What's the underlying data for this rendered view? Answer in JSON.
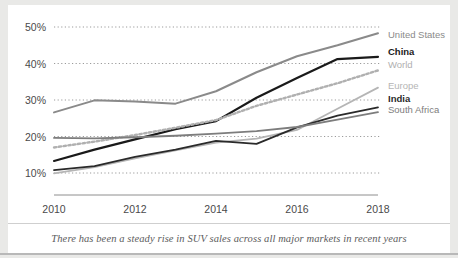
{
  "caption": "There has been a steady rise in SUV sales across all major markets in recent years",
  "axis": {
    "y_ticks": [
      "10%",
      "20%",
      "30%",
      "40%",
      "50%"
    ],
    "x_ticks": [
      "2010",
      "2012",
      "2014",
      "2016",
      "2018"
    ]
  },
  "legend": [
    {
      "label": "United States",
      "color": "#8a8a8a",
      "bold": false
    },
    {
      "label": "China",
      "color": "#1a1a1a",
      "bold": true
    },
    {
      "label": "World",
      "color": "#b0b0b0",
      "bold": false
    },
    {
      "label": "Europe",
      "color": "#b5b5b5",
      "bold": false
    },
    {
      "label": "India",
      "color": "#2a2a2a",
      "bold": true
    },
    {
      "label": "South Africa",
      "color": "#7d7d7d",
      "bold": false
    }
  ],
  "chart_data": {
    "type": "line",
    "title": "",
    "subtitle": "",
    "xlabel": "",
    "ylabel": "",
    "x": [
      2010,
      2011,
      2012,
      2013,
      2014,
      2015,
      2016,
      2017,
      2018
    ],
    "xlim": [
      2010,
      2018
    ],
    "ylim": [
      8,
      51
    ],
    "ytick_values": [
      10,
      20,
      30,
      40,
      50
    ],
    "xtick_values": [
      2010,
      2012,
      2014,
      2016,
      2018
    ],
    "grid": "horizontal-dotted",
    "legend_position": "right-of-plot-line-end",
    "units": "percent",
    "series": [
      {
        "name": "United States",
        "color": "#8a8a8a",
        "style": "solid",
        "width": 2.0,
        "values": [
          26.6,
          29.9,
          29.6,
          29.0,
          32.4,
          37.6,
          42.0,
          45.0,
          48.3
        ]
      },
      {
        "name": "China",
        "color": "#1a1a1a",
        "style": "solid",
        "width": 2.2,
        "values": [
          13.3,
          16.4,
          19.2,
          22.0,
          24.2,
          30.6,
          36.0,
          41.2,
          41.8
        ]
      },
      {
        "name": "World",
        "color": "#b0b0b0",
        "style": "dotted",
        "width": 2.4,
        "values": [
          17.0,
          18.6,
          20.4,
          22.4,
          24.5,
          28.4,
          31.5,
          34.6,
          38.1
        ]
      },
      {
        "name": "Europe",
        "color": "#b5b5b5",
        "style": "solid",
        "width": 1.8,
        "values": [
          9.9,
          11.6,
          14.0,
          16.2,
          18.3,
          19.4,
          21.8,
          27.6,
          33.4
        ]
      },
      {
        "name": "India",
        "color": "#2a2a2a",
        "style": "solid",
        "width": 1.8,
        "values": [
          10.8,
          11.9,
          14.4,
          16.4,
          18.8,
          18.0,
          22.5,
          25.7,
          28.0
        ]
      },
      {
        "name": "South Africa",
        "color": "#7d7d7d",
        "style": "solid",
        "width": 1.8,
        "values": [
          19.6,
          19.5,
          19.8,
          20.2,
          20.8,
          21.5,
          22.6,
          24.6,
          26.7
        ]
      }
    ]
  }
}
